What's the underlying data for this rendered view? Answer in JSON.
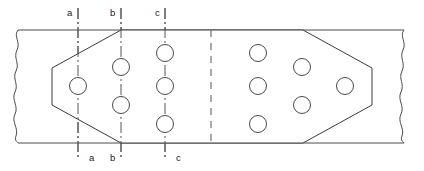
{
  "drawing": {
    "title": "Bolted splice plate hole layout",
    "canvas": {
      "width": 424,
      "height": 171
    },
    "style": {
      "line_color": "#4a4a4a",
      "outline_color": "#3c3c3c",
      "centerline_color": "#555555",
      "hole_edge_color": "#4a4a4a",
      "fill_color": "#ffffff",
      "text_color": "#1a1a1a",
      "line_width": 1,
      "hole_radius": 8.5
    },
    "member": {
      "name": "continuous-member",
      "top_edge_y": 30,
      "bottom_edge_y": 143,
      "left_break_x": 18,
      "right_break_x": 404,
      "break_style": "freehand-wavy"
    },
    "plate": {
      "name": "splice-plate",
      "outline_points": "121,30 303,30 372,68 372,105 303,143 121,143 52,105 52,68",
      "left_chamfer_top": "52,68 121,30",
      "left_chamfer_bottom": "52,105 121,143",
      "right_chamfer_top": "303,30 372,68",
      "right_chamfer_bottom": "303,143 372,105",
      "left_vertical_x": 52,
      "right_vertical_x": 372
    },
    "symmetry_line": {
      "name": "centerline-of-symmetry",
      "x": 211,
      "y_top": 30,
      "y_bottom": 146,
      "style": "dashed"
    },
    "gauge_lines": [
      {
        "id": "a",
        "x": 78,
        "y_top": 8,
        "y_bottom": 160,
        "style": "dash-dot"
      },
      {
        "id": "b",
        "x": 121,
        "y_top": 8,
        "y_bottom": 160,
        "style": "dash-dot"
      },
      {
        "id": "c",
        "x": 165,
        "y_top": 8,
        "y_bottom": 160,
        "style": "dash-dot"
      }
    ],
    "labels_top": [
      {
        "id": "a",
        "text": "a",
        "x": 67,
        "y": 16
      },
      {
        "id": "b",
        "text": "b",
        "x": 110,
        "y": 16
      },
      {
        "id": "c",
        "text": "c",
        "x": 155,
        "y": 16
      }
    ],
    "labels_bottom": [
      {
        "id": "a",
        "text": "a",
        "x": 89,
        "y": 161
      },
      {
        "id": "b",
        "text": "b",
        "x": 110,
        "y": 161
      },
      {
        "id": "c",
        "text": "c",
        "x": 176,
        "y": 161
      }
    ],
    "holes_left": [
      {
        "column": "a",
        "cx": 78,
        "cy": 86,
        "r": 8.5
      },
      {
        "column": "b",
        "cx": 121,
        "cy": 67,
        "r": 8.5
      },
      {
        "column": "b",
        "cx": 121,
        "cy": 105,
        "r": 8.5
      },
      {
        "column": "c",
        "cx": 165,
        "cy": 53,
        "r": 8.5
      },
      {
        "column": "c",
        "cx": 165,
        "cy": 86,
        "r": 8.5
      },
      {
        "column": "c",
        "cx": 165,
        "cy": 124,
        "r": 8.5
      }
    ],
    "holes_right": [
      {
        "column": "a-mirror",
        "cx": 345,
        "cy": 86,
        "r": 8.5
      },
      {
        "column": "b-mirror",
        "cx": 302,
        "cy": 67,
        "r": 8.5
      },
      {
        "column": "b-mirror",
        "cx": 302,
        "cy": 105,
        "r": 8.5
      },
      {
        "column": "c-mirror",
        "cx": 258,
        "cy": 53,
        "r": 8.5
      },
      {
        "column": "c-mirror",
        "cx": 258,
        "cy": 86,
        "r": 8.5
      },
      {
        "column": "c-mirror",
        "cx": 258,
        "cy": 124,
        "r": 8.5
      }
    ],
    "break_left_path": "M 18,30 C 13,36 21,42 17,50 C 13,58 20,63 16,71 C 12,79 19,84 15,92 C 11,100 19,106 15,114 C 11,122 19,128 16,136 C 14,141 17,141 18,143",
    "break_right_path": "M 404,30 C 399,36 407,42 403,50 C 399,58 406,63 402,71 C 398,79 405,84 401,92 C 397,100 405,106 401,114 C 397,122 405,128 402,136 C 400,141 403,141 404,143"
  }
}
